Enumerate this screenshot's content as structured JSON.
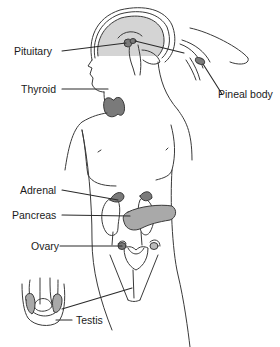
{
  "diagram": {
    "type": "anatomical-diagram",
    "colors": {
      "outline": "#3a3a3a",
      "gland_fill": "#7a7a7a",
      "brain_fill": "#d4d4d4",
      "pancreas_fill": "#a9a9a9",
      "label_text": "#1a1a1a"
    },
    "labels": [
      {
        "id": "pituitary",
        "text": "Pituitary"
      },
      {
        "id": "thyroid",
        "text": "Thyroid"
      },
      {
        "id": "pineal",
        "text": "Pineal body"
      },
      {
        "id": "adrenal",
        "text": "Adrenal"
      },
      {
        "id": "pancreas",
        "text": "Pancreas"
      },
      {
        "id": "ovary",
        "text": "Ovary"
      },
      {
        "id": "testis",
        "text": "Testis"
      }
    ]
  }
}
